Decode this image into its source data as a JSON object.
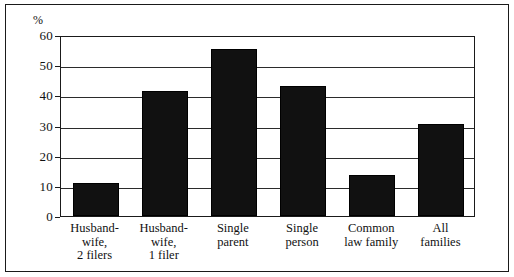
{
  "chart_data": {
    "type": "bar",
    "title": "",
    "subtitle": "",
    "xlabel": "",
    "ylabel": "%",
    "ylim": [
      0,
      60
    ],
    "ytick_values": [
      0,
      10,
      20,
      30,
      40,
      50,
      60
    ],
    "ytick_labels": [
      "0",
      "10",
      "20",
      "30",
      "40",
      "50",
      "60"
    ],
    "grid": true,
    "legend": false,
    "legend_position": "none",
    "bar_color": "#111111",
    "axis_color": "#1a1a1a",
    "categories": [
      "Husband-wife, 2 filers",
      "Husband-wife, 1 filer",
      "Single parent",
      "Single person",
      "Common law family",
      "All families"
    ],
    "category_lines": [
      [
        "Husband-",
        "wife,",
        "2 filers"
      ],
      [
        "Husband-",
        "wife,",
        "1 filer"
      ],
      [
        "Single",
        "parent"
      ],
      [
        "Single",
        "person"
      ],
      [
        "Common",
        "law family"
      ],
      [
        "All",
        "families"
      ]
    ],
    "values": [
      11,
      41.5,
      55.5,
      43,
      13.5,
      30.5
    ]
  }
}
